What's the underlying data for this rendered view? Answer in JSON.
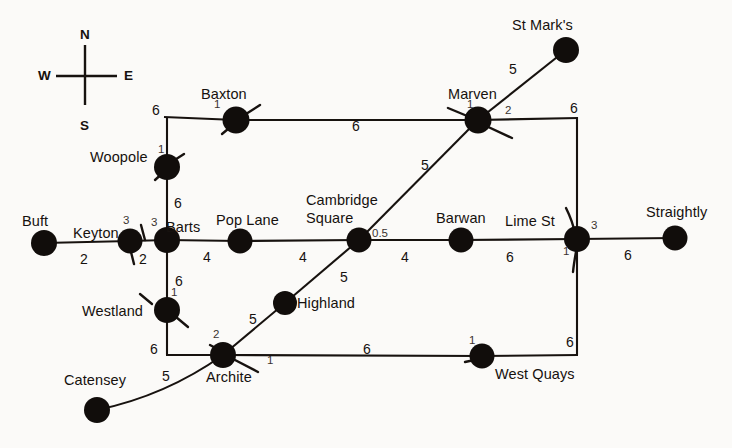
{
  "diagram": {
    "background_color": "#fbfaf8",
    "ink_color": "#16110e"
  },
  "compass": {
    "north": "N",
    "south": "S",
    "east": "E",
    "west": "W"
  },
  "stations": [
    {
      "id": "buft",
      "label": "Buft",
      "x": 44,
      "y": 243
    },
    {
      "id": "keyton",
      "label": "Keyton",
      "x": 130,
      "y": 241
    },
    {
      "id": "barts",
      "label": "Barts",
      "x": 167,
      "y": 240
    },
    {
      "id": "pop_lane",
      "label": "Pop Lane",
      "x": 240,
      "y": 241
    },
    {
      "id": "cambridge",
      "label": "Cambridge Square",
      "x": 359,
      "y": 240
    },
    {
      "id": "barwan",
      "label": "Barwan",
      "x": 461,
      "y": 240
    },
    {
      "id": "lime_st",
      "label": "Lime St",
      "x": 577,
      "y": 239
    },
    {
      "id": "straightly",
      "label": "Straightly",
      "x": 675,
      "y": 238
    },
    {
      "id": "woopole",
      "label": "Woopole",
      "x": 167,
      "y": 167
    },
    {
      "id": "baxton",
      "label": "Baxton",
      "x": 236,
      "y": 120
    },
    {
      "id": "marven",
      "label": "Marven",
      "x": 478,
      "y": 120
    },
    {
      "id": "st_marks",
      "label": "St Mark's",
      "x": 566,
      "y": 50
    },
    {
      "id": "westland",
      "label": "Westland",
      "x": 167,
      "y": 310
    },
    {
      "id": "archite",
      "label": "Archite",
      "x": 223,
      "y": 355
    },
    {
      "id": "highland",
      "label": "Highland",
      "x": 285,
      "y": 303
    },
    {
      "id": "west_quays",
      "label": "West Quays",
      "x": 482,
      "y": 356
    },
    {
      "id": "catensey",
      "label": "Catensey",
      "x": 97,
      "y": 410
    }
  ],
  "edges": [
    {
      "from": "buft",
      "to": "keyton",
      "weight": "2"
    },
    {
      "from": "keyton",
      "to": "barts",
      "weight": ""
    },
    {
      "from": "barts",
      "to": "pop_lane",
      "weight": "4"
    },
    {
      "from": "pop_lane",
      "to": "cambridge",
      "weight": "4"
    },
    {
      "from": "cambridge",
      "to": "barwan",
      "weight": "4"
    },
    {
      "from": "barwan",
      "to": "lime_st",
      "weight": "6"
    },
    {
      "from": "lime_st",
      "to": "straightly",
      "weight": "6"
    },
    {
      "from": "barts",
      "to": "woopole",
      "weight": "6"
    },
    {
      "from": "woopole",
      "to": "baxton",
      "weight": "6"
    },
    {
      "from": "baxton",
      "to": "marven",
      "weight": "6"
    },
    {
      "from": "marven",
      "to": "lime_st",
      "weight": "6"
    },
    {
      "from": "marven",
      "to": "st_marks",
      "weight": "5"
    },
    {
      "from": "marven",
      "to": "cambridge",
      "weight": "5"
    },
    {
      "from": "cambridge",
      "to": "highland",
      "weight": "5"
    },
    {
      "from": "highland",
      "to": "archite",
      "weight": "5"
    },
    {
      "from": "barts",
      "to": "westland",
      "weight": "6"
    },
    {
      "from": "westland",
      "to": "archite",
      "weight": "6"
    },
    {
      "from": "archite",
      "to": "west_quays",
      "weight": "6"
    },
    {
      "from": "west_quays",
      "to": "lime_st",
      "weight": "6"
    },
    {
      "from": "archite",
      "to": "catensey",
      "weight": "5"
    }
  ],
  "edge_weight_labels": [
    {
      "id": "w-buft-keyton",
      "text": "2",
      "x": 80,
      "y": 256
    },
    {
      "id": "w-keyton-barts",
      "text": "2",
      "x": 140,
      "y": 258
    },
    {
      "id": "w-barts-poplane",
      "text": "4",
      "x": 203,
      "y": 254
    },
    {
      "id": "w-poplane-cambridge",
      "text": "4",
      "x": 299,
      "y": 254
    },
    {
      "id": "w-cambridge-barwan",
      "text": "4",
      "x": 401,
      "y": 254
    },
    {
      "id": "w-barwan-limest",
      "text": "6",
      "x": 506,
      "y": 254
    },
    {
      "id": "w-limest-straightly",
      "text": "6",
      "x": 624,
      "y": 252
    },
    {
      "id": "w-barts-woopole",
      "text": "6",
      "x": 174,
      "y": 202
    },
    {
      "id": "w-woopole-baxton",
      "text": "6",
      "x": 156,
      "y": 110
    },
    {
      "id": "w-baxton-marven",
      "text": "6",
      "x": 355,
      "y": 126
    },
    {
      "id": "w-marven-limest",
      "text": "6",
      "x": 572,
      "y": 108
    },
    {
      "id": "w-marven-stmarks",
      "text": "5",
      "x": 511,
      "y": 71
    },
    {
      "id": "w-marven-cambridge",
      "text": "5",
      "x": 423,
      "y": 166
    },
    {
      "id": "w-cambridge-highland",
      "text": "5",
      "x": 342,
      "y": 276
    },
    {
      "id": "w-highland-archite",
      "text": "5",
      "x": 251,
      "y": 318
    },
    {
      "id": "w-barts-westland",
      "text": "6",
      "x": 175,
      "y": 280
    },
    {
      "id": "w-westland-archite",
      "text": "6",
      "x": 152,
      "y": 348
    },
    {
      "id": "w-archite-westquays",
      "text": "6",
      "x": 365,
      "y": 348
    },
    {
      "id": "w-westquays-limest",
      "text": "6",
      "x": 568,
      "y": 341
    },
    {
      "id": "w-archite-catensey",
      "text": "5",
      "x": 164,
      "y": 375
    }
  ],
  "junction_labels": [
    {
      "id": "j-keyton-top",
      "text": "3",
      "x": 123,
      "y": 219
    },
    {
      "id": "j-keyton-bottom",
      "text": "2",
      "x": 140,
      "y": 258
    },
    {
      "id": "j-barts",
      "text": "3",
      "x": 152,
      "y": 221
    },
    {
      "id": "j-woopole",
      "text": "1",
      "x": 159,
      "y": 148
    },
    {
      "id": "j-baxton",
      "text": "1",
      "x": 215,
      "y": 103
    },
    {
      "id": "j-marven-left",
      "text": "1",
      "x": 468,
      "y": 103
    },
    {
      "id": "j-marven-right",
      "text": "2",
      "x": 506,
      "y": 110
    },
    {
      "id": "j-cambridge",
      "text": "0.5",
      "x": 374,
      "y": 232
    },
    {
      "id": "j-limest-right",
      "text": "3",
      "x": 592,
      "y": 224
    },
    {
      "id": "j-limest-bottom",
      "text": "1",
      "x": 564,
      "y": 250
    },
    {
      "id": "j-westland",
      "text": "1",
      "x": 172,
      "y": 291
    },
    {
      "id": "j-archite-top",
      "text": "2",
      "x": 214,
      "y": 333
    },
    {
      "id": "j-archite-right",
      "text": "1",
      "x": 268,
      "y": 359
    },
    {
      "id": "j-westquays",
      "text": "1",
      "x": 470,
      "y": 339
    }
  ],
  "station_name_labels": [
    {
      "id": "n-buft",
      "text": "Buft",
      "x": 22,
      "y": 214
    },
    {
      "id": "n-keyton",
      "text": "Keyton",
      "x": 73,
      "y": 226
    },
    {
      "id": "n-barts",
      "text": "Barts",
      "x": 166,
      "y": 220
    },
    {
      "id": "n-poplane",
      "text": "Pop Lane",
      "x": 216,
      "y": 213
    },
    {
      "id": "n-cambridge1",
      "text": "Cambridge",
      "x": 306,
      "y": 193
    },
    {
      "id": "n-cambridge2",
      "text": "Square",
      "x": 318,
      "y": 211
    },
    {
      "id": "n-barwan",
      "text": "Barwan",
      "x": 436,
      "y": 211
    },
    {
      "id": "n-limest",
      "text": "Lime St",
      "x": 505,
      "y": 214
    },
    {
      "id": "n-straightly",
      "text": "Straightly",
      "x": 646,
      "y": 205
    },
    {
      "id": "n-woopole",
      "text": "Woopole",
      "x": 90,
      "y": 150
    },
    {
      "id": "n-baxton",
      "text": "Baxton",
      "x": 201,
      "y": 87
    },
    {
      "id": "n-marven",
      "text": "Marven",
      "x": 448,
      "y": 87
    },
    {
      "id": "n-stmarks",
      "text": "St Mark's",
      "x": 512,
      "y": 18
    },
    {
      "id": "n-westland",
      "text": "Westland",
      "x": 82,
      "y": 304
    },
    {
      "id": "n-highland",
      "text": "Highland",
      "x": 297,
      "y": 296
    },
    {
      "id": "n-archite",
      "text": "Archite",
      "x": 206,
      "y": 370
    },
    {
      "id": "n-westquays",
      "text": "West Quays",
      "x": 495,
      "y": 367
    },
    {
      "id": "n-catensey",
      "text": "Catensey",
      "x": 64,
      "y": 373
    }
  ]
}
